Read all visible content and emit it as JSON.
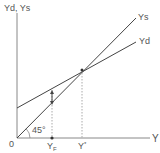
{
  "diagram": {
    "y_axis_label": "Yd, Ys",
    "x_axis_label": "Y",
    "origin_label": "0",
    "angle_label": "45°",
    "lines": [
      {
        "name": "Ys",
        "label": "Ys"
      },
      {
        "name": "Yd",
        "label": "Yd"
      }
    ],
    "x_ticks": [
      {
        "label": "YF",
        "main": "Y",
        "sub": "F"
      },
      {
        "label": "Y*",
        "main": "Y",
        "sup": "*"
      }
    ],
    "colors": {
      "axis": "#777777",
      "line": "#444444",
      "dotted": "#aaaaaa",
      "text": "#555555"
    }
  }
}
